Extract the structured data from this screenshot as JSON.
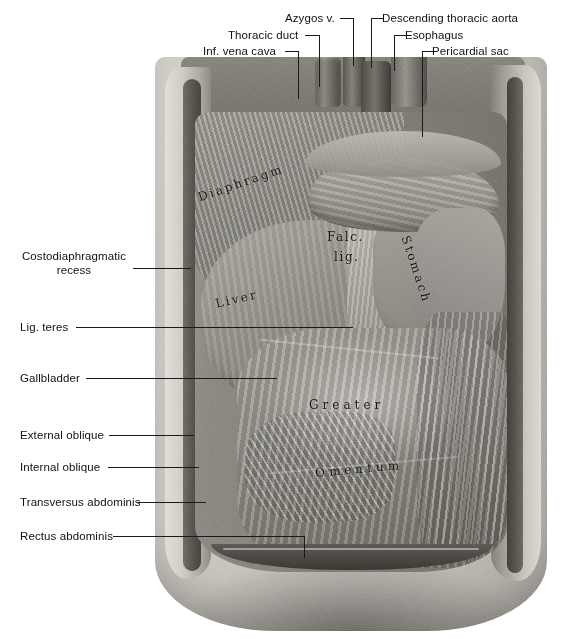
{
  "figure": {
    "kind": "anatomical-illustration",
    "background_color": "#ffffff",
    "leader_line_color": "#1a1a1a",
    "label_text_color": "#111111",
    "annotation_text_color": "#17150f"
  },
  "callouts": {
    "top": [
      {
        "id": "inf-vena-cava",
        "label": "Inf. vena cava"
      },
      {
        "id": "thoracic-duct",
        "label": "Thoracic duct"
      },
      {
        "id": "azygos-vein",
        "label": "Azygos v."
      },
      {
        "id": "descending-thoracic-aorta",
        "label": "Descending thoracic aorta"
      },
      {
        "id": "esophagus",
        "label": "Esophagus"
      },
      {
        "id": "pericardial-sac",
        "label": "Pericardial sac"
      }
    ],
    "left": [
      {
        "id": "costodiaphragmatic-recess",
        "label": "Costodiaphragmatic\nrecess"
      },
      {
        "id": "lig-teres",
        "label": "Lig. teres"
      },
      {
        "id": "gallbladder",
        "label": "Gallbladder"
      },
      {
        "id": "external-oblique",
        "label": "External oblique"
      },
      {
        "id": "internal-oblique",
        "label": "Internal oblique"
      },
      {
        "id": "transversus-abdominis",
        "label": "Transversus abdominis"
      },
      {
        "id": "rectus-abdominis",
        "label": "Rectus abdominis"
      }
    ]
  },
  "annotations": [
    {
      "id": "diaphragm",
      "label": "Diaphragm"
    },
    {
      "id": "falciform-abbr",
      "label": "Falc."
    },
    {
      "id": "ligament-abbr",
      "label": "lig."
    },
    {
      "id": "liver",
      "label": "Liver"
    },
    {
      "id": "stomach",
      "label": "Stomach"
    },
    {
      "id": "greater",
      "label": "Greater"
    },
    {
      "id": "omentum",
      "label": "Omentum"
    }
  ]
}
